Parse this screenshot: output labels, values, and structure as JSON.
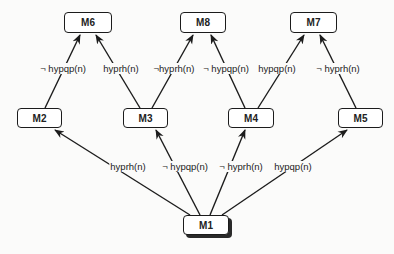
{
  "diagram": {
    "nodes": [
      {
        "id": "M6",
        "label": "M6",
        "x": 64,
        "y": 12,
        "w": 48,
        "h": 21
      },
      {
        "id": "M8",
        "label": "M8",
        "x": 180,
        "y": 12,
        "w": 46,
        "h": 21
      },
      {
        "id": "M7",
        "label": "M7",
        "x": 290,
        "y": 12,
        "w": 47,
        "h": 21
      },
      {
        "id": "M2",
        "label": "M2",
        "x": 17,
        "y": 108,
        "w": 45,
        "h": 20
      },
      {
        "id": "M3",
        "label": "M3",
        "x": 123,
        "y": 108,
        "w": 45,
        "h": 20
      },
      {
        "id": "M4",
        "label": "M4",
        "x": 228,
        "y": 108,
        "w": 46,
        "h": 20
      },
      {
        "id": "M5",
        "label": "M5",
        "x": 338,
        "y": 108,
        "w": 45,
        "h": 20
      },
      {
        "id": "M1",
        "label": "M1",
        "x": 183,
        "y": 215,
        "w": 46,
        "h": 20,
        "shadow": true
      }
    ],
    "edges": [
      {
        "from": "M1",
        "to": "M2",
        "label": "hyprh(n)",
        "x1": 190,
        "y1": 215,
        "x2": 55,
        "y2": 130,
        "lx": 128,
        "ly": 167
      },
      {
        "from": "M1",
        "to": "M3",
        "label": "¬ hypqp(n)",
        "x1": 200,
        "y1": 215,
        "x2": 156,
        "y2": 130,
        "lx": 185,
        "ly": 167
      },
      {
        "from": "M1",
        "to": "M4",
        "label": "¬ hyprh(n)",
        "x1": 210,
        "y1": 215,
        "x2": 245,
        "y2": 130,
        "lx": 241,
        "ly": 167
      },
      {
        "from": "M1",
        "to": "M5",
        "label": "hypqp(n)",
        "x1": 222,
        "y1": 215,
        "x2": 347,
        "y2": 130,
        "lx": 293,
        "ly": 167
      },
      {
        "from": "M2",
        "to": "M6",
        "label": "¬ hypqp(n)",
        "x1": 45,
        "y1": 108,
        "x2": 80,
        "y2": 35,
        "lx": 63,
        "ly": 69
      },
      {
        "from": "M3",
        "to": "M6",
        "label": "hyprh(n)",
        "x1": 140,
        "y1": 108,
        "x2": 96,
        "y2": 35,
        "lx": 121,
        "ly": 69
      },
      {
        "from": "M3",
        "to": "M8",
        "label": "¬hyprh(n)",
        "x1": 152,
        "y1": 108,
        "x2": 193,
        "y2": 35,
        "lx": 174,
        "ly": 69
      },
      {
        "from": "M4",
        "to": "M8",
        "label": "¬ hypqp(n)",
        "x1": 245,
        "y1": 108,
        "x2": 211,
        "y2": 35,
        "lx": 226,
        "ly": 69
      },
      {
        "from": "M4",
        "to": "M7",
        "label": "hypqp(n)",
        "x1": 258,
        "y1": 108,
        "x2": 304,
        "y2": 35,
        "lx": 277,
        "ly": 69
      },
      {
        "from": "M5",
        "to": "M7",
        "label": "¬ hyprh(n)",
        "x1": 356,
        "y1": 108,
        "x2": 320,
        "y2": 35,
        "lx": 338,
        "ly": 69
      }
    ]
  },
  "colors": {
    "stroke": "#1c1c1c",
    "background": "#fbfbfa"
  }
}
